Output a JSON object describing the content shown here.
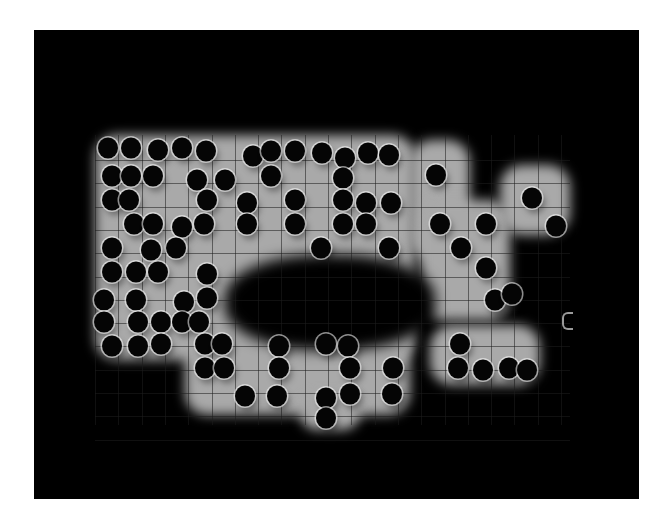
{
  "image": {
    "description": "Grayscale micrograph of a square grid lattice with dark circular pits on a glowing light-gray substrate, surrounded by black background",
    "colors": {
      "background": "#000000",
      "substrate": "#a9a9a9",
      "dot": "#050505",
      "frame_border": "#ffffff"
    },
    "grid": {
      "origin_x": 103,
      "origin_y": 160,
      "pitch": 23.3,
      "cols": 20,
      "rows": 12
    },
    "glow_regions": [
      {
        "x": 95,
        "y": 135,
        "w": 320,
        "h": 225
      },
      {
        "x": 185,
        "y": 330,
        "w": 225,
        "h": 85
      },
      {
        "x": 300,
        "y": 395,
        "w": 60,
        "h": 35
      },
      {
        "x": 410,
        "y": 140,
        "w": 60,
        "h": 120
      },
      {
        "x": 420,
        "y": 200,
        "w": 90,
        "h": 120
      },
      {
        "x": 430,
        "y": 325,
        "w": 110,
        "h": 60
      },
      {
        "x": 500,
        "y": 165,
        "w": 70,
        "h": 70
      }
    ],
    "dark_hole": {
      "x": 225,
      "y": 255,
      "w": 210,
      "h": 95
    },
    "dots": [
      [
        108,
        148
      ],
      [
        131,
        148
      ],
      [
        158,
        150
      ],
      [
        182,
        148
      ],
      [
        206,
        151
      ],
      [
        253,
        156
      ],
      [
        271,
        151
      ],
      [
        295,
        151
      ],
      [
        322,
        153
      ],
      [
        345,
        158
      ],
      [
        368,
        153
      ],
      [
        389,
        155
      ],
      [
        112,
        176
      ],
      [
        131,
        176
      ],
      [
        153,
        176
      ],
      [
        197,
        180
      ],
      [
        225,
        180
      ],
      [
        271,
        176
      ],
      [
        343,
        178
      ],
      [
        436,
        175
      ],
      [
        112,
        200
      ],
      [
        129,
        200
      ],
      [
        207,
        200
      ],
      [
        247,
        203
      ],
      [
        295,
        200
      ],
      [
        343,
        200
      ],
      [
        366,
        203
      ],
      [
        391,
        203
      ],
      [
        532,
        198
      ],
      [
        134,
        224
      ],
      [
        153,
        224
      ],
      [
        182,
        227
      ],
      [
        204,
        224
      ],
      [
        247,
        224
      ],
      [
        295,
        224
      ],
      [
        343,
        224
      ],
      [
        366,
        224
      ],
      [
        440,
        224
      ],
      [
        486,
        224
      ],
      [
        556,
        226
      ],
      [
        112,
        248
      ],
      [
        151,
        250
      ],
      [
        176,
        248
      ],
      [
        321,
        248
      ],
      [
        389,
        248
      ],
      [
        461,
        248
      ],
      [
        112,
        272
      ],
      [
        136,
        272
      ],
      [
        158,
        272
      ],
      [
        207,
        274
      ],
      [
        486,
        268
      ],
      [
        104,
        300
      ],
      [
        136,
        300
      ],
      [
        184,
        302
      ],
      [
        207,
        298
      ],
      [
        495,
        300
      ],
      [
        512,
        294
      ],
      [
        104,
        322
      ],
      [
        138,
        322
      ],
      [
        161,
        322
      ],
      [
        182,
        322
      ],
      [
        199,
        322
      ],
      [
        112,
        346
      ],
      [
        138,
        346
      ],
      [
        161,
        344
      ],
      [
        205,
        344
      ],
      [
        222,
        344
      ],
      [
        279,
        346
      ],
      [
        326,
        344
      ],
      [
        348,
        346
      ],
      [
        460,
        344
      ],
      [
        205,
        368
      ],
      [
        224,
        368
      ],
      [
        279,
        368
      ],
      [
        350,
        368
      ],
      [
        393,
        368
      ],
      [
        458,
        368
      ],
      [
        483,
        370
      ],
      [
        509,
        368
      ],
      [
        527,
        370
      ],
      [
        245,
        396
      ],
      [
        277,
        396
      ],
      [
        326,
        398
      ],
      [
        350,
        394
      ],
      [
        392,
        394
      ],
      [
        326,
        418
      ]
    ],
    "artifact": {
      "x": 562,
      "y": 312,
      "shape": "bracket"
    }
  }
}
